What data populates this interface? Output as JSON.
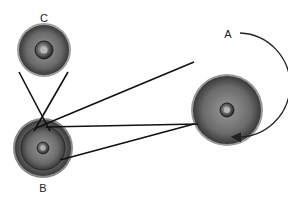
{
  "diagram": {
    "type": "belt-and-pulley",
    "pulleys": [
      {
        "id": "A",
        "label": "A",
        "cx": 227,
        "cy": 110,
        "r": 36,
        "hub_r": 7
      },
      {
        "id": "B",
        "label": "B",
        "cx": 43,
        "cy": 148,
        "r": 30,
        "inner_r": 22,
        "hub_r": 6
      },
      {
        "id": "C",
        "label": "C",
        "cx": 44,
        "cy": 50,
        "r": 27,
        "hub_r": 9
      }
    ],
    "rotation_direction": "clockwise",
    "colors": {
      "pulley_dark": "#3a3a3a",
      "pulley_mid": "#7a7a7a",
      "pulley_light": "#a8a8a8",
      "belt": "#111111",
      "background": "#ffffff"
    }
  }
}
